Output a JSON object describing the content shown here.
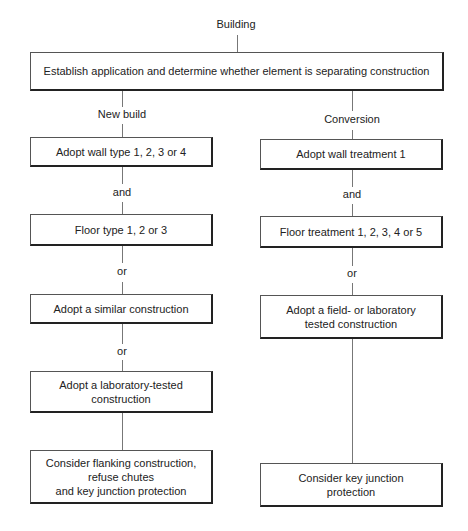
{
  "diagram": {
    "root_label": "Building",
    "top_box": "Establish application and determine whether element is separating construction",
    "branches": {
      "new_build": {
        "label": "New build",
        "steps": [
          "Adopt wall type 1, 2, 3 or 4",
          "Floor type 1, 2 or 3",
          "Adopt a similar construction",
          "Adopt a laboratory-tested\nconstruction",
          "Consider  flanking construction,\nrefuse chutes\n and key junction protection"
        ],
        "connectors": [
          "and",
          "or",
          "or"
        ]
      },
      "conversion": {
        "label": "Conversion",
        "steps": [
          "Adopt wall treatment 1",
          "Floor treatment 1, 2, 3, 4 or 5",
          "Adopt a field- or laboratory\ntested construction",
          "Consider key junction\nprotection"
        ],
        "connectors": [
          "and",
          "or"
        ]
      }
    }
  }
}
